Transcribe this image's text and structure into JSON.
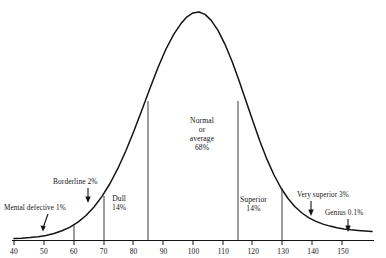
{
  "chart_data": {
    "type": "line",
    "title": "",
    "subtitle": "",
    "xlabel": "",
    "ylabel": "",
    "xlim": [
      40,
      153
    ],
    "ylim": [
      0,
      1
    ],
    "grid": false,
    "legend": null,
    "curve": {
      "name": "IQ normal distribution",
      "mean": 100,
      "sd": 15,
      "description": "Gaussian bell curve of IQ scores"
    },
    "x_ticks": [
      40,
      50,
      60,
      70,
      80,
      90,
      100,
      110,
      120,
      130,
      140,
      150
    ],
    "x_tick_labels": [
      "40",
      "50",
      "60",
      "70",
      "80",
      "90",
      "100",
      "110",
      "120",
      "130",
      "140",
      "150"
    ],
    "dividers": [
      60,
      70,
      85,
      115,
      130
    ],
    "bands": [
      {
        "id": "mental-defective",
        "label": "Mental defective 1%",
        "name": "Mental defective",
        "percent": "1%",
        "range": [
          40,
          60
        ],
        "pointer": "arrow"
      },
      {
        "id": "borderline",
        "label": "Borderline 2%",
        "name": "Borderline",
        "percent": "2%",
        "range": [
          60,
          70
        ],
        "pointer": "arrow"
      },
      {
        "id": "dull",
        "label": "Dull\n14%",
        "name": "Dull",
        "percent": "14%",
        "range": [
          70,
          85
        ],
        "pointer": "none"
      },
      {
        "id": "normal-average",
        "label": "Normal or average 68%",
        "name": "Normal or average",
        "percent": "68%",
        "range": [
          85,
          115
        ],
        "pointer": "none"
      },
      {
        "id": "superior",
        "label": "Superior 14%",
        "name": "Superior",
        "percent": "14%",
        "range": [
          115,
          130
        ],
        "pointer": "none"
      },
      {
        "id": "very-superior",
        "label": "Very superior 3%",
        "name": "Very superior",
        "percent": "3%",
        "range": [
          130,
          145
        ],
        "pointer": "arrow"
      },
      {
        "id": "genius",
        "label": "Genius 0.1%",
        "name": "Genius",
        "percent": "0.1%",
        "range": [
          145,
          153
        ],
        "pointer": "arrow"
      }
    ]
  },
  "labels": {
    "mental_defective": "Mental defective 1%",
    "borderline": "Borderline 2%",
    "dull_name": "Dull",
    "dull_percent": "14%",
    "normal_line1": "Normal",
    "normal_line2": "or",
    "normal_line3": "average",
    "normal_percent": "68%",
    "superior_name": "Superior",
    "superior_percent": "14%",
    "very_superior": "Very superior 3%",
    "genius": "Genius 0.1%"
  },
  "axis": {
    "ticks": [
      {
        "value": "40",
        "x": 40
      },
      {
        "value": "50",
        "x": 50
      },
      {
        "value": "60",
        "x": 60
      },
      {
        "value": "70",
        "x": 70
      },
      {
        "value": "80",
        "x": 80
      },
      {
        "value": "90",
        "x": 90
      },
      {
        "value": "100",
        "x": 100
      },
      {
        "value": "110",
        "x": 110
      },
      {
        "value": "120",
        "x": 120
      },
      {
        "value": "130",
        "x": 130
      },
      {
        "value": "140",
        "x": 140
      },
      {
        "value": "150",
        "x": 150
      }
    ]
  },
  "colors": {
    "curve": "#141414",
    "axis": "#141414",
    "divider": "#4a4a4a",
    "text": "#141414",
    "background": "#ffffff"
  }
}
